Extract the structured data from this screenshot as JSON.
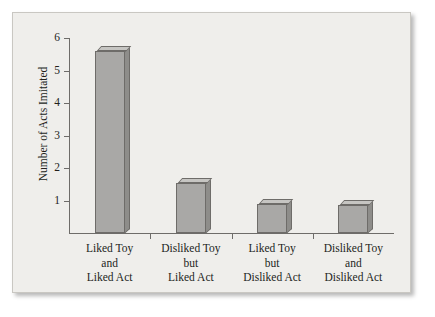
{
  "chart_data": {
    "type": "bar",
    "title": "",
    "xlabel": "",
    "ylabel": "Number of Acts Imitated",
    "ylim": [
      0,
      6
    ],
    "yticks": [
      1,
      2,
      3,
      4,
      5,
      6
    ],
    "ytick_labels": [
      "1",
      "2",
      "3",
      "4",
      "5",
      "6"
    ],
    "grid": false,
    "legend": null,
    "categories": [
      "Liked Toy and Liked Act",
      "Disliked Toy but Liked Act",
      "Liked Toy but Disliked Act",
      "Disliked Toy and Disliked Act"
    ],
    "category_lines": [
      [
        "Liked Toy",
        "and",
        "Liked Act"
      ],
      [
        "Disliked Toy",
        "but",
        "Liked Act"
      ],
      [
        "Liked Toy",
        "but",
        "Disliked Act"
      ],
      [
        "Disliked Toy",
        "and",
        "Disliked Act"
      ]
    ],
    "values": [
      5.6,
      1.55,
      0.88,
      0.85
    ],
    "bar_style": "3d",
    "bar_color": "#a9a8a6",
    "bar_top_color": "#c6c5c2",
    "bar_side_color": "#8e8d8a",
    "bar_edge_color": "#6e6c69",
    "axis_color": "#6e6c69",
    "text_color": "#231f1c",
    "panel_color": "#efeeeb",
    "panel_border_color": "#c9c7c2",
    "background_color": "#ffffff"
  }
}
